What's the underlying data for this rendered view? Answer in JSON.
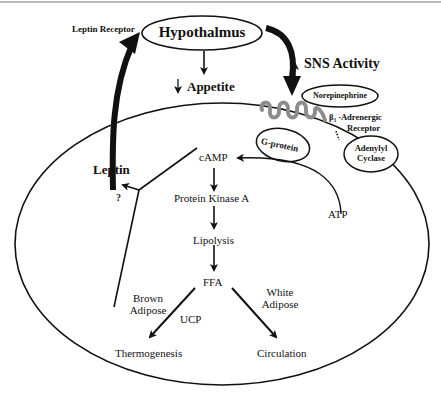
{
  "diagram": {
    "nodes": {
      "hypothalamus": "Hypothalmus",
      "leptin_receptor": "Leptin Receptor",
      "appetite": "Appetite",
      "appetite_direction": "↓",
      "sns_activity": "SNS Activity",
      "sns_direction": "↑",
      "norepinephrine": "Norepinephrine",
      "b3_receptor_line1": "β₃ -Adrenergic",
      "b3_receptor_line2": "Receptor",
      "g_protein": "G-protein",
      "adenylyl_cyclase_line1": "Adenylyl",
      "adenylyl_cyclase_line2": "Cyclase",
      "leptin": "Leptin",
      "question": "?",
      "camp": "cAMP",
      "atp": "ATP",
      "protein_kinase_a": "Protein Kinase A",
      "lipolysis": "Lipolysis",
      "ffa": "FFA",
      "brown_adipose_line1": "Brown",
      "brown_adipose_line2": "Adipose",
      "white_adipose_line1": "White",
      "white_adipose_line2": "Adipose",
      "ucp": "UCP",
      "thermogenesis": "Thermogenesis",
      "circulation": "Circulation"
    },
    "edges": [
      {
        "from": "Leptin",
        "to": "Leptin Receptor / Hypothalmus",
        "style": "thick"
      },
      {
        "from": "Hypothalmus",
        "to": "Appetite"
      },
      {
        "from": "Hypothalmus",
        "to": "β3-Adrenergic Receptor",
        "label": "SNS Activity",
        "style": "thick"
      },
      {
        "from": "ATP",
        "to": "cAMP",
        "via": "Adenylyl Cyclase"
      },
      {
        "from": "cAMP",
        "to": "Protein Kinase A"
      },
      {
        "from": "Protein Kinase A",
        "to": "Lipolysis"
      },
      {
        "from": "Lipolysis",
        "to": "FFA"
      },
      {
        "from": "FFA",
        "to": "Thermogenesis",
        "label": "UCP",
        "context": "Brown Adipose"
      },
      {
        "from": "FFA",
        "to": "Circulation",
        "context": "White Adipose"
      },
      {
        "from": "cAMP",
        "to": "Leptin",
        "label": "?"
      }
    ]
  }
}
